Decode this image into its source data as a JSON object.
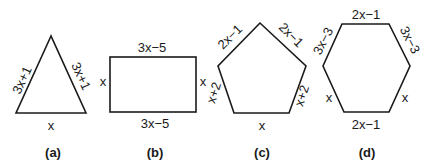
{
  "figures": [
    {
      "id": "a",
      "caption": "(a)",
      "shape": "triangle",
      "labels": {
        "left": "3x+1",
        "right": "3x+1",
        "bottom": "x"
      }
    },
    {
      "id": "b",
      "caption": "(b)",
      "shape": "rectangle",
      "labels": {
        "top": "3x−5",
        "bottom": "3x−5",
        "left": "x",
        "right": "x"
      }
    },
    {
      "id": "c",
      "caption": "(c)",
      "shape": "pentagon",
      "labels": {
        "upper_left": "2x−1",
        "upper_right": "2x−1",
        "lower_left": "x+2",
        "lower_right": "x+2",
        "bottom": "x"
      }
    },
    {
      "id": "d",
      "caption": "(d)",
      "shape": "hexagon",
      "labels": {
        "top": "2x−1",
        "upper_left": "3x−3",
        "upper_right": "3x−3",
        "lower_left": "x",
        "lower_right": "x",
        "bottom": "2x−1"
      }
    }
  ],
  "colors": {
    "stroke": "#1a1a1a",
    "background": "#ffffff"
  }
}
